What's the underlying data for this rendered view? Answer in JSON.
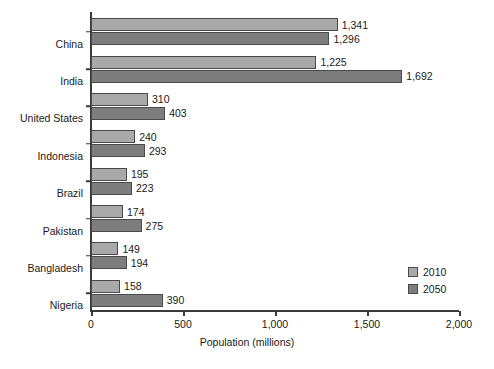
{
  "chart_data": {
    "type": "bar",
    "orientation": "horizontal",
    "title": "",
    "xlabel": "Population (millions)",
    "ylabel": "",
    "xlim": [
      0,
      2000
    ],
    "xticks": [
      "0",
      "500",
      "1,000",
      "1,500",
      "2,000"
    ],
    "xtick_values": [
      0,
      500,
      1000,
      1500,
      2000
    ],
    "grid": false,
    "legend_position": "bottom-right",
    "categories": [
      "China",
      "India",
      "United States",
      "Indonesia",
      "Brazil",
      "Pakistan",
      "Bangladesh",
      "Nigeria"
    ],
    "series": [
      {
        "name": "2010",
        "color": "#a9a9a9",
        "values": [
          1341,
          1225,
          310,
          240,
          195,
          174,
          149,
          158
        ],
        "labels": [
          "1,341",
          "1,225",
          "310",
          "240",
          "195",
          "174",
          "149",
          "158"
        ]
      },
      {
        "name": "2050",
        "color": "#7d7d7d",
        "values": [
          1296,
          1692,
          403,
          293,
          223,
          275,
          194,
          390
        ],
        "labels": [
          "1,296",
          "1,692",
          "403",
          "293",
          "223",
          "275",
          "194",
          "390"
        ]
      }
    ]
  },
  "legend": {
    "items": [
      {
        "label": "2010",
        "color": "#a9a9a9"
      },
      {
        "label": "2050",
        "color": "#7d7d7d"
      }
    ]
  },
  "colors": {
    "background": "#ffffff",
    "axis": "#3a3a3a",
    "text": "#1a1a1a",
    "series_2010": "#a9a9a9",
    "series_2050": "#7d7d7d",
    "bar_border": "#4a4a4a"
  }
}
